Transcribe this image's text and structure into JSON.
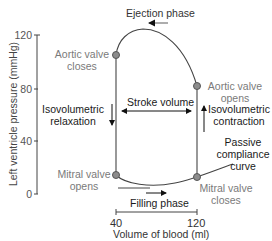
{
  "diagram": {
    "y_axis": {
      "label": "Left ventricle pressure (mmHg)",
      "ticks": [
        "120",
        "80",
        "40",
        "0"
      ]
    },
    "x_axis": {
      "label": "Volume of blood (ml)",
      "ticks": [
        "40",
        "120"
      ]
    },
    "points": {
      "aortic_valve_closes": [
        "Aortic valve",
        "closes"
      ],
      "aortic_valve_opens": [
        "Aortic valve",
        "opens"
      ],
      "mitral_valve_opens": [
        "Mitral valve",
        "opens"
      ],
      "mitral_valve_closes": [
        "Mitral valve",
        "closes"
      ]
    },
    "phases": {
      "ejection": "Ejection phase",
      "stroke_volume": "Stroke volume",
      "isovolumetric_relaxation": [
        "Isovolumetric",
        "relaxation"
      ],
      "isovolumetric_contraction": [
        "Isovolumetric",
        "contraction"
      ],
      "passive_compliance": [
        "Passive",
        "compliance",
        "curve"
      ],
      "filling": "Filling phase"
    },
    "colors": {
      "line": "#444444",
      "dot_fill": "#8c8c8c",
      "dot_stroke": "#555555",
      "grey_text": "#7a7a7a",
      "dark_text": "#1a1a1a"
    }
  }
}
